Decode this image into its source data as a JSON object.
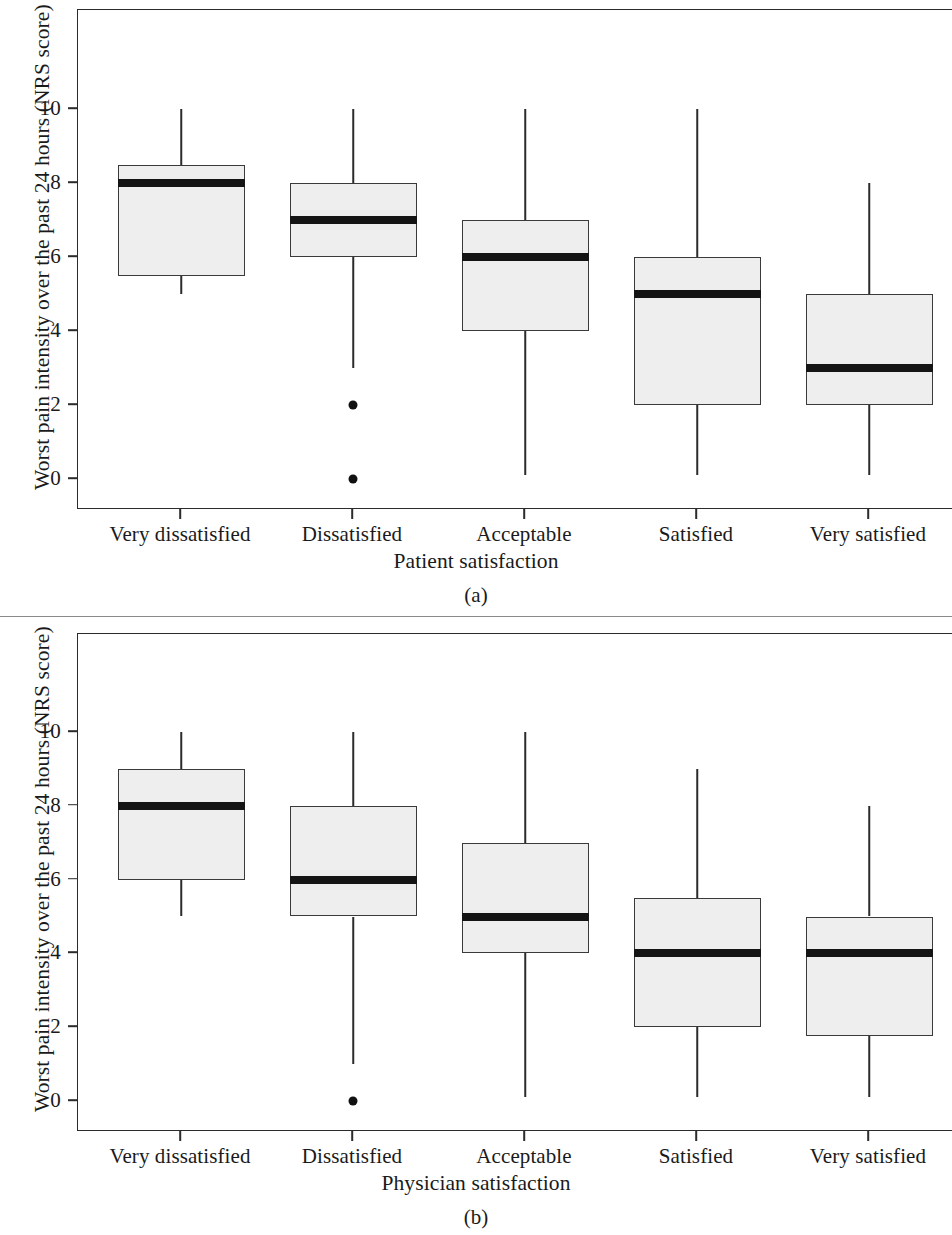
{
  "figure": {
    "background": "#ffffff",
    "box_fill": "#eeeeee",
    "line_color": "#2b2b2b",
    "median_color": "#141414"
  },
  "chart_data": [
    {
      "type": "box",
      "panel_label": "(a)",
      "title": "",
      "xlabel": "Patient satisfaction",
      "ylabel": "Worst pain intensity over the past 24 hours (NRS score)",
      "categories": [
        "Very dissatisfied",
        "Dissatisfied",
        "Acceptable",
        "Satisfied",
        "Very satisfied"
      ],
      "yticks": [
        0,
        2,
        4,
        6,
        8,
        10
      ],
      "ytick_labels": [
        "0",
        "2",
        "4",
        "6",
        "8",
        "10"
      ],
      "ylim": [
        -0.8,
        11.7
      ],
      "grid": false,
      "legend": null,
      "boxes": [
        {
          "category": "Very dissatisfied",
          "whisker_low": 5.0,
          "q1": 5.5,
          "median": 8.0,
          "q3": 8.5,
          "whisker_high": 10.0,
          "outliers": []
        },
        {
          "category": "Dissatisfied",
          "whisker_low": 3.0,
          "q1": 6.0,
          "median": 7.0,
          "q3": 8.0,
          "whisker_high": 10.0,
          "outliers": [
            2.0,
            0.0
          ]
        },
        {
          "category": "Acceptable",
          "whisker_low": 0.1,
          "q1": 4.0,
          "median": 6.0,
          "q3": 7.0,
          "whisker_high": 10.0,
          "outliers": []
        },
        {
          "category": "Satisfied",
          "whisker_low": 0.1,
          "q1": 2.0,
          "median": 5.0,
          "q3": 6.0,
          "whisker_high": 10.0,
          "outliers": []
        },
        {
          "category": "Very satisfied",
          "whisker_low": 0.1,
          "q1": 2.0,
          "median": 3.0,
          "q3": 5.0,
          "whisker_high": 8.0,
          "outliers": []
        }
      ]
    },
    {
      "type": "box",
      "panel_label": "(b)",
      "title": "",
      "xlabel": "Physician satisfaction",
      "ylabel": "Worst pain intensity over the past 24 hours (NRS score)",
      "categories": [
        "Very dissatisfied",
        "Dissatisfied",
        "Acceptable",
        "Satisfied",
        "Very satisfied"
      ],
      "yticks": [
        0,
        2,
        4,
        6,
        8,
        10
      ],
      "ytick_labels": [
        "0",
        "2",
        "4",
        "6",
        "8",
        "10"
      ],
      "ylim": [
        -0.8,
        11.7
      ],
      "grid": false,
      "legend": null,
      "boxes": [
        {
          "category": "Very dissatisfied",
          "whisker_low": 5.0,
          "q1": 6.0,
          "median": 8.0,
          "q3": 9.0,
          "whisker_high": 10.0,
          "outliers": []
        },
        {
          "category": "Dissatisfied",
          "whisker_low": 1.0,
          "q1": 5.0,
          "median": 6.0,
          "q3": 8.0,
          "whisker_high": 10.0,
          "outliers": [
            0.0
          ]
        },
        {
          "category": "Acceptable",
          "whisker_low": 0.1,
          "q1": 4.0,
          "median": 5.0,
          "q3": 7.0,
          "whisker_high": 10.0,
          "outliers": []
        },
        {
          "category": "Satisfied",
          "whisker_low": 0.1,
          "q1": 2.0,
          "median": 4.0,
          "q3": 5.5,
          "whisker_high": 9.0,
          "outliers": []
        },
        {
          "category": "Very satisfied",
          "whisker_low": 0.1,
          "q1": 1.75,
          "median": 4.0,
          "q3": 5.0,
          "whisker_high": 8.0,
          "outliers": []
        }
      ]
    }
  ]
}
